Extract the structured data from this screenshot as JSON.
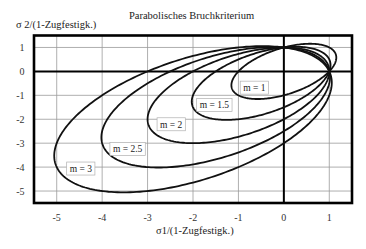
{
  "chart_data": {
    "type": "line",
    "title": "Parabolisches Bruchkriterium",
    "xlabel": "σ1/(1-Zugfestigk.)",
    "ylabel": "σ 2/(1-Zugfestigk.)",
    "xlim": [
      -5.5,
      1.5
    ],
    "ylim": [
      -5.5,
      1.5
    ],
    "x_ticks": [
      "-5",
      "-4",
      "-3",
      "-2",
      "-1",
      "0",
      "1"
    ],
    "y_ticks": [
      "1",
      "0",
      "-1",
      "-2",
      "-3",
      "-4",
      "-5"
    ],
    "grid": true,
    "zero_lines": true,
    "legend": "inline boxed labels",
    "equation": "σ1² + σ2² − σ1·σ2 + (m−1)(σ1+σ2) = m",
    "common_points": [
      [
        1,
        0
      ],
      [
        0,
        1
      ]
    ],
    "series": [
      {
        "name": "m = 1",
        "m": 1,
        "label_pos": [
          -0.65,
          -0.68
        ],
        "x_range": [
          -1.155,
          1.155
        ],
        "y_range": [
          -1.155,
          1.155
        ],
        "leftmost": [
          -1.155,
          -0.577
        ],
        "rightmost": [
          1.155,
          0.577
        ],
        "bottommost": [
          -0.577,
          -1.155
        ],
        "topmost": [
          0.577,
          1.155
        ]
      },
      {
        "name": "m = 1.5",
        "m": 1.5,
        "label_pos": [
          -1.53,
          -1.4
        ],
        "x_range": [
          -2.028,
          1.028
        ],
        "y_range": [
          -2.028,
          1.028
        ],
        "leftmost": [
          -2.028,
          -1.264
        ],
        "rightmost": [
          1.028,
          0.264
        ],
        "bottommost": [
          -1.264,
          -2.028
        ],
        "topmost": [
          0.264,
          1.028
        ]
      },
      {
        "name": "m = 2",
        "m": 2,
        "label_pos": [
          -2.48,
          -2.21
        ],
        "x_range": [
          -3.0,
          1.0
        ],
        "y_range": [
          -3.0,
          1.0
        ],
        "leftmost": [
          -3.0,
          -2.0
        ],
        "rightmost": [
          1.0,
          0.0
        ],
        "bottommost": [
          -2.0,
          -3.0
        ],
        "topmost": [
          0.0,
          1.0
        ]
      },
      {
        "name": "m = 2.5",
        "m": 2.5,
        "label_pos": [
          -3.44,
          -3.24
        ],
        "x_range": [
          -4.017,
          1.017
        ],
        "y_range": [
          -4.017,
          1.017
        ],
        "leftmost": [
          -4.017,
          -2.758
        ],
        "rightmost": [
          1.017,
          0.258
        ],
        "bottommost": [
          -2.758,
          -4.017
        ],
        "topmost": [
          0.258,
          1.017
        ]
      },
      {
        "name": "m = 3",
        "m": 3,
        "label_pos": [
          -4.47,
          -4.06
        ],
        "x_range": [
          -5.055,
          1.055
        ],
        "y_range": [
          -5.055,
          1.055
        ],
        "leftmost": [
          -5.055,
          -3.528
        ],
        "rightmost": [
          1.055,
          0.528
        ],
        "bottommost": [
          -3.528,
          -5.055
        ],
        "topmost": [
          0.528,
          1.055
        ]
      }
    ]
  }
}
